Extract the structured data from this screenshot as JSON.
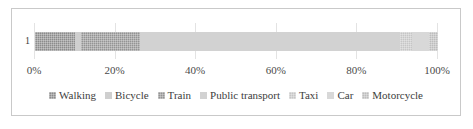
{
  "chart_data": {
    "type": "bar",
    "subtype": "stacked-horizontal-100-percent",
    "title": "",
    "xlabel": "",
    "ylabel": "",
    "categories": [
      "1"
    ],
    "xlim": [
      0,
      100
    ],
    "xticks": [
      "0%",
      "20%",
      "40%",
      "60%",
      "80%",
      "100%"
    ],
    "xtick_values": [
      0,
      20,
      40,
      60,
      80,
      100
    ],
    "grid": true,
    "grid_axis": "x",
    "legend_position": "bottom",
    "units": "percent",
    "series": [
      {
        "name": "Walking",
        "values": [
          10.0
        ],
        "color": "#8c8c8c",
        "pattern": "dither"
      },
      {
        "name": "Bicycle",
        "values": [
          1.3
        ],
        "color": "#cfcfcf",
        "pattern": "solid"
      },
      {
        "name": "Train",
        "values": [
          14.7
        ],
        "color": "#949494",
        "pattern": "dither"
      },
      {
        "name": "Public transport",
        "values": [
          64.5
        ],
        "color": "#d2d2d2",
        "pattern": "solid"
      },
      {
        "name": "Taxi",
        "values": [
          3.0
        ],
        "color": "#c6c6c6",
        "pattern": "dither"
      },
      {
        "name": "Car",
        "values": [
          4.3
        ],
        "color": "#d8d8d8",
        "pattern": "solid"
      },
      {
        "name": "Motorcycle",
        "values": [
          2.2
        ],
        "color": "#bdbdbd",
        "pattern": "dither"
      }
    ]
  },
  "legend": {
    "items": [
      {
        "label": "Walking"
      },
      {
        "label": "Bicycle"
      },
      {
        "label": "Train"
      },
      {
        "label": "Public transport"
      },
      {
        "label": "Taxi"
      },
      {
        "label": "Car"
      },
      {
        "label": "Motorcycle"
      }
    ]
  },
  "axis": {
    "category_label": "1"
  },
  "colors": {
    "frame_border": "#c9c9c9",
    "gridline": "#e3e3e3",
    "axis_line": "#d5d5d5",
    "text": "#3d3d3d"
  }
}
